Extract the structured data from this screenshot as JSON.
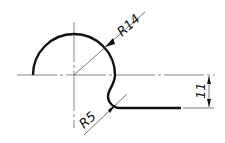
{
  "drawing": {
    "type": "engineering-profile-sketch",
    "colors": {
      "outline": "#111111",
      "thin": "#555555",
      "background": "#ffffff"
    },
    "dimensions": {
      "large_radius": {
        "label": "R14",
        "value": 14
      },
      "fillet_radius": {
        "label": "R5",
        "value": 5
      },
      "vertical_offset": {
        "label": "11",
        "value": 11
      }
    }
  }
}
